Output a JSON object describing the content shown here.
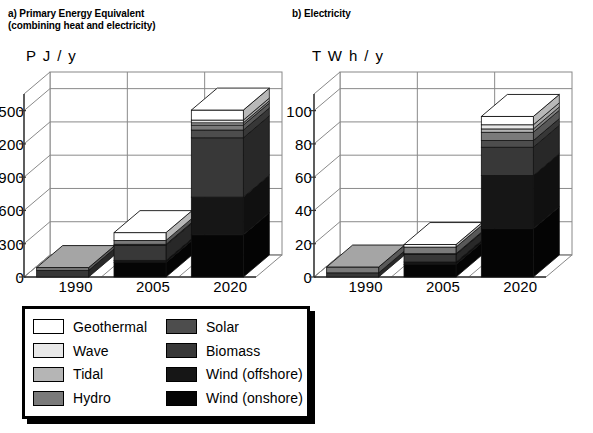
{
  "panels": [
    {
      "id": "a",
      "title": "a) Primary Energy Equivalent\n(combining heat and electricity)",
      "unit": "P J / y"
    },
    {
      "id": "b",
      "title": "b) Electricity",
      "unit": "T W h / y"
    }
  ],
  "legend": {
    "items": [
      {
        "label": "Geothermal",
        "key": "geothermal",
        "color": "#ffffff"
      },
      {
        "label": "Solar",
        "key": "solar",
        "color": "#4d4d4d"
      },
      {
        "label": "Wave",
        "key": "wave",
        "color": "#e8e8e8"
      },
      {
        "label": "Biomass",
        "key": "biomass",
        "color": "#383838"
      },
      {
        "label": "Tidal",
        "key": "tidal",
        "color": "#b5b5b5"
      },
      {
        "label": "Wind (offshore)",
        "key": "wind_offshore",
        "color": "#161616"
      },
      {
        "label": "Hydro",
        "key": "hydro",
        "color": "#7a7a7a"
      },
      {
        "label": "Wind (onshore)",
        "key": "wind_onshore",
        "color": "#050505"
      }
    ]
  },
  "chart_data": [
    {
      "id": "a",
      "type": "bar",
      "stacked": true,
      "title": "a) Primary Energy Equivalent (combining heat and electricity)",
      "xlabel": "",
      "ylabel": "P J / y",
      "categories": [
        "1990",
        "2005",
        "2020"
      ],
      "yticks": [
        0,
        300,
        600,
        900,
        1200,
        1500
      ],
      "ylim": [
        0,
        1650
      ],
      "grid": true,
      "legend_position": "below",
      "series": [
        {
          "name": "Wind (onshore)",
          "key": "wind_onshore",
          "color": "#050505",
          "values": [
            0,
            130,
            380
          ]
        },
        {
          "name": "Wind (offshore)",
          "key": "wind_offshore",
          "color": "#161616",
          "values": [
            0,
            20,
            340
          ]
        },
        {
          "name": "Biomass",
          "key": "biomass",
          "color": "#383838",
          "values": [
            60,
            135,
            535
          ]
        },
        {
          "name": "Solar",
          "key": "solar",
          "color": "#4d4d4d",
          "values": [
            0,
            10,
            70
          ]
        },
        {
          "name": "Hydro",
          "key": "hydro",
          "color": "#7a7a7a",
          "values": [
            25,
            35,
            45
          ]
        },
        {
          "name": "Tidal",
          "key": "tidal",
          "color": "#b5b5b5",
          "values": [
            0,
            0,
            20
          ]
        },
        {
          "name": "Wave",
          "key": "wave",
          "color": "#e8e8e8",
          "values": [
            0,
            0,
            25
          ]
        },
        {
          "name": "Geothermal",
          "key": "geothermal",
          "color": "#ffffff",
          "values": [
            0,
            70,
            90
          ]
        }
      ],
      "totals": [
        85,
        400,
        1505
      ]
    },
    {
      "id": "b",
      "type": "bar",
      "stacked": true,
      "title": "b) Electricity",
      "xlabel": "",
      "ylabel": "T W h / y",
      "categories": [
        "1990",
        "2005",
        "2020"
      ],
      "yticks": [
        0,
        20,
        40,
        60,
        80,
        100
      ],
      "ylim": [
        0,
        110
      ],
      "grid": true,
      "legend_position": "below",
      "series": [
        {
          "name": "Wind (onshore)",
          "key": "wind_onshore",
          "color": "#050505",
          "values": [
            0,
            7.5,
            29
          ]
        },
        {
          "name": "Wind (offshore)",
          "key": "wind_offshore",
          "color": "#161616",
          "values": [
            0,
            1.5,
            32
          ]
        },
        {
          "name": "Biomass",
          "key": "biomass",
          "color": "#383838",
          "values": [
            2.5,
            4.5,
            17
          ]
        },
        {
          "name": "Solar",
          "key": "solar",
          "color": "#4d4d4d",
          "values": [
            0,
            0.5,
            4
          ]
        },
        {
          "name": "Hydro",
          "key": "hydro",
          "color": "#7a7a7a",
          "values": [
            3.5,
            4.0,
            5
          ]
        },
        {
          "name": "Tidal",
          "key": "tidal",
          "color": "#b5b5b5",
          "values": [
            0,
            0,
            2
          ]
        },
        {
          "name": "Wave",
          "key": "wave",
          "color": "#e8e8e8",
          "values": [
            0,
            0,
            2.5
          ]
        },
        {
          "name": "Geothermal",
          "key": "geothermal",
          "color": "#ffffff",
          "values": [
            0,
            1.5,
            5
          ]
        }
      ],
      "totals": [
        6,
        19.5,
        96.5
      ]
    }
  ]
}
